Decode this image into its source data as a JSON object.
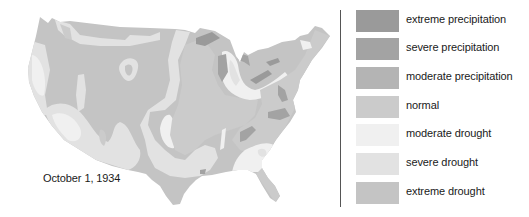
{
  "map": {
    "date_label": "October 1, 1934",
    "colors": {
      "extreme_precipitation": "#9a9a9a",
      "severe_precipitation": "#a3a3a3",
      "moderate_precipitation": "#b4b4b4",
      "normal": "#cbcbcb",
      "moderate_drought": "#f0f0f0",
      "severe_drought": "#e2e2e2",
      "extreme_drought": "#c4c4c4"
    }
  },
  "legend": {
    "items": [
      {
        "label": "extreme precipitation",
        "color": "#9a9a9a"
      },
      {
        "label": "severe precipitation",
        "color": "#a3a3a3"
      },
      {
        "label": "moderate precipitation",
        "color": "#b4b4b4"
      },
      {
        "label": "normal",
        "color": "#cbcbcb"
      },
      {
        "label": "moderate drought",
        "color": "#f0f0f0"
      },
      {
        "label": "severe drought",
        "color": "#e2e2e2"
      },
      {
        "label": "extreme drought",
        "color": "#c4c4c4"
      }
    ]
  }
}
